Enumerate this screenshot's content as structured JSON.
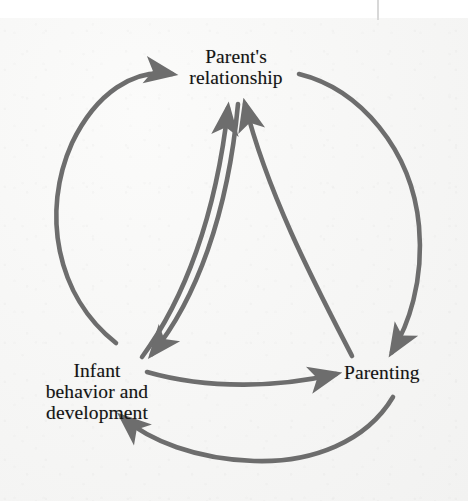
{
  "figure": {
    "kind": "cycle-diagram",
    "background_color": "#f4f4f3",
    "stroke_color": "#6d6d6d",
    "text_color": "#141414"
  },
  "nodes": {
    "parents_relationship": {
      "line1": "Parent's",
      "line2": "relationship"
    },
    "infant": {
      "line1": "Infant",
      "line2": "behavior and",
      "line3": "development"
    },
    "parenting": {
      "line1": "Parenting"
    }
  },
  "arrows": [
    {
      "name": "outer-infant-to-parents-relationship",
      "from": "Infant behavior and development",
      "to": "Parent's relationship",
      "path": "outer-left-arc"
    },
    {
      "name": "outer-parents-relationship-to-parenting",
      "from": "Parent's relationship",
      "to": "Parenting",
      "path": "outer-right-arc"
    },
    {
      "name": "outer-parenting-to-infant",
      "from": "Parenting",
      "to": "Infant behavior and development",
      "path": "outer-bottom-arc"
    },
    {
      "name": "inner-infant-to-parents-relationship",
      "from": "Infant behavior and development",
      "to": "Parent's relationship",
      "path": "inner-left-curve"
    },
    {
      "name": "inner-parents-relationship-to-infant",
      "from": "Parent's relationship",
      "to": "Infant behavior and development",
      "path": "inner-left-curve-return"
    },
    {
      "name": "inner-infant-to-parenting",
      "from": "Infant behavior and development",
      "to": "Parenting",
      "path": "inner-bottom-curve"
    },
    {
      "name": "inner-parenting-to-parents-relationship",
      "from": "Parenting",
      "to": "Parent's relationship",
      "path": "inner-right-curve"
    }
  ]
}
